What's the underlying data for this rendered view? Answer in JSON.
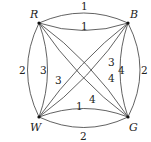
{
  "graph": {
    "vertices": [
      {
        "id": "R",
        "label": "R"
      },
      {
        "id": "B",
        "label": "B"
      },
      {
        "id": "W",
        "label": "W"
      },
      {
        "id": "G",
        "label": "G"
      }
    ],
    "edges": [
      {
        "from": "R",
        "to": "B",
        "weight": "1",
        "position": "outer"
      },
      {
        "from": "R",
        "to": "B",
        "weight": "1",
        "position": "inner"
      },
      {
        "from": "W",
        "to": "G",
        "weight": "1",
        "position": "inner"
      },
      {
        "from": "W",
        "to": "G",
        "weight": "2",
        "position": "outer"
      },
      {
        "from": "R",
        "to": "W",
        "weight": "2",
        "position": "outer"
      },
      {
        "from": "R",
        "to": "W",
        "weight": "3",
        "position": "inner"
      },
      {
        "from": "B",
        "to": "G",
        "weight": "2",
        "position": "outer"
      },
      {
        "from": "B",
        "to": "G",
        "weight": "4",
        "position": "inner"
      },
      {
        "from": "B",
        "to": "W",
        "weight": "3",
        "position": "upper"
      },
      {
        "from": "B",
        "to": "W",
        "weight": "3",
        "position": "lower"
      },
      {
        "from": "R",
        "to": "G",
        "weight": "4",
        "position": "upper"
      },
      {
        "from": "R",
        "to": "G",
        "weight": "4",
        "position": "lower"
      }
    ]
  }
}
